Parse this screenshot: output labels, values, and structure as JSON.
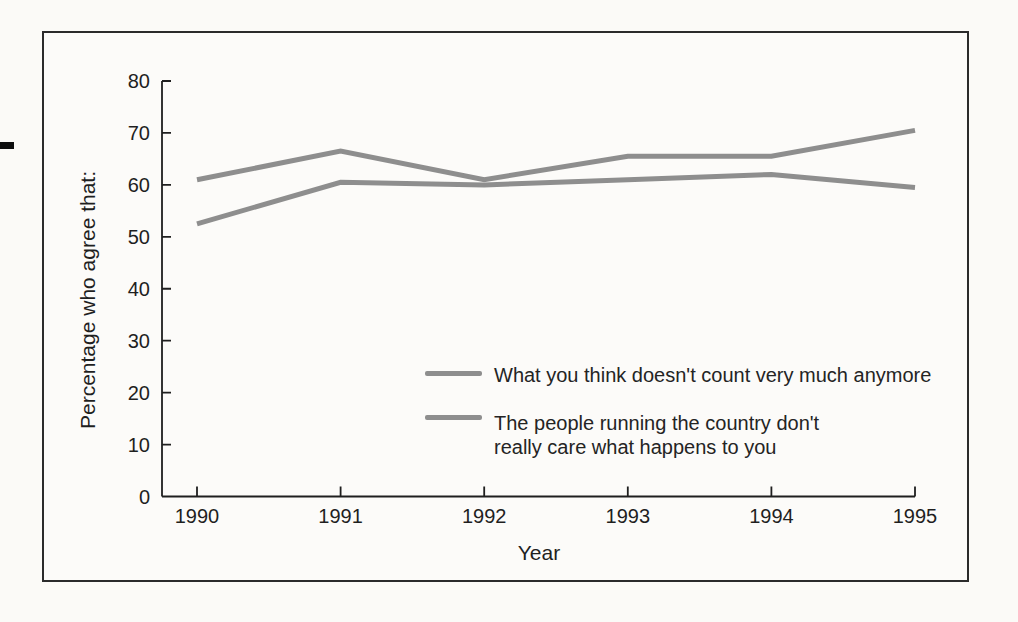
{
  "figure": {
    "background_color": "#fbfaf7",
    "border_color": "#2b2b2b",
    "text_color": "#1f1f1f"
  },
  "chart_data": {
    "type": "line",
    "title": "",
    "xlabel": "Year",
    "ylabel": "Percentage who agree that:",
    "x": [
      1990,
      1991,
      1992,
      1993,
      1994,
      1995
    ],
    "xlim": [
      1990,
      1995
    ],
    "ylim": [
      0,
      80
    ],
    "yticks": [
      0,
      10,
      20,
      30,
      40,
      50,
      60,
      70,
      80
    ],
    "grid": false,
    "line_color": "#8e8e8e",
    "line_width": 5,
    "axis_color": "#1f1f1f",
    "legend_position": "inside lower-right",
    "series": [
      {
        "name": "What you think doesn't count very much anymore",
        "values": [
          61,
          66.5,
          61,
          65.5,
          65.5,
          70.5
        ]
      },
      {
        "name": "The people running the country don't really care what happens to you",
        "values": [
          52.5,
          60.5,
          60,
          61,
          62,
          59.5
        ]
      }
    ],
    "legend": [
      {
        "lines": [
          "What you think doesn't count very much anymore"
        ]
      },
      {
        "lines": [
          "The people running the country don't",
          "really care what happens to you"
        ]
      }
    ]
  }
}
